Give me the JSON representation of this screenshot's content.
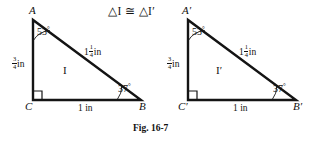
{
  "figure": {
    "title": "△I ≅ △I′",
    "caption": "Fig. 16-7",
    "caption_label": "Fig.",
    "caption_number": "16-7"
  },
  "units": {
    "inch": "in",
    "degree": "°"
  },
  "triangles": [
    {
      "id": "triangle-1",
      "region_label": "I",
      "vertices": {
        "apex": "A",
        "right_angle": "C",
        "base_right": "B"
      },
      "angles": {
        "apex": "53",
        "base_right": "37",
        "right_angle": "90"
      },
      "sides": {
        "vertical_whole": "",
        "vertical_num": "3",
        "vertical_den": "4",
        "vertical_unit": "in",
        "hypotenuse_whole": "1",
        "hypotenuse_num": "1",
        "hypotenuse_den": "4",
        "hypotenuse_unit": "in",
        "base_whole": "1",
        "base_unit": "in",
        "base_text": "1 in"
      }
    },
    {
      "id": "triangle-2",
      "region_label": "I′",
      "vertices": {
        "apex": "A′",
        "right_angle": "C′",
        "base_right": "B′"
      },
      "angles": {
        "apex": "53",
        "base_right": "37",
        "right_angle": "90"
      },
      "sides": {
        "vertical_whole": "",
        "vertical_num": "3",
        "vertical_den": "4",
        "vertical_unit": "in",
        "hypotenuse_whole": "1",
        "hypotenuse_num": "1",
        "hypotenuse_den": "4",
        "hypotenuse_unit": "in",
        "base_whole": "1",
        "base_unit": "in",
        "base_text": "1 in"
      }
    }
  ],
  "style": {
    "stroke_color": "#141414",
    "background": "#ffffff"
  }
}
